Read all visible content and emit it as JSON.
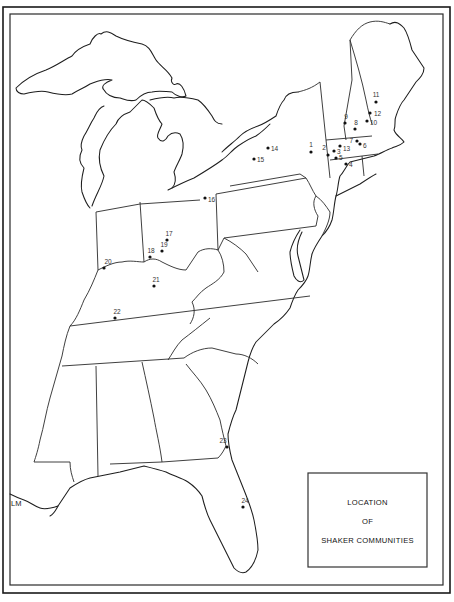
{
  "map": {
    "title_lines": [
      "LOCATION",
      "OF",
      "SHAKER COMMUNITIES"
    ],
    "credit": "LM",
    "marker_color": "#111111",
    "line_color": "#1e1e1e",
    "communities": [
      {
        "id": "1",
        "region": "New York"
      },
      {
        "id": "2",
        "region": "New York"
      },
      {
        "id": "3",
        "region": "Massachusetts"
      },
      {
        "id": "4",
        "region": "Connecticut"
      },
      {
        "id": "5",
        "region": "Massachusetts"
      },
      {
        "id": "6",
        "region": "Massachusetts"
      },
      {
        "id": "7",
        "region": "Massachusetts"
      },
      {
        "id": "8",
        "region": "New Hampshire"
      },
      {
        "id": "9",
        "region": "New Hampshire"
      },
      {
        "id": "10",
        "region": "Maine"
      },
      {
        "id": "11",
        "region": "Maine"
      },
      {
        "id": "12",
        "region": "Maine"
      },
      {
        "id": "13",
        "region": "Massachusetts"
      },
      {
        "id": "14",
        "region": "New York"
      },
      {
        "id": "15",
        "region": "New York"
      },
      {
        "id": "16",
        "region": "Ohio"
      },
      {
        "id": "17",
        "region": "Ohio"
      },
      {
        "id": "18",
        "region": "Ohio"
      },
      {
        "id": "19",
        "region": "Ohio"
      },
      {
        "id": "20",
        "region": "Indiana"
      },
      {
        "id": "21",
        "region": "Kentucky"
      },
      {
        "id": "22",
        "region": "Kentucky"
      },
      {
        "id": "23",
        "region": "Georgia"
      },
      {
        "id": "24",
        "region": "Florida"
      }
    ]
  }
}
